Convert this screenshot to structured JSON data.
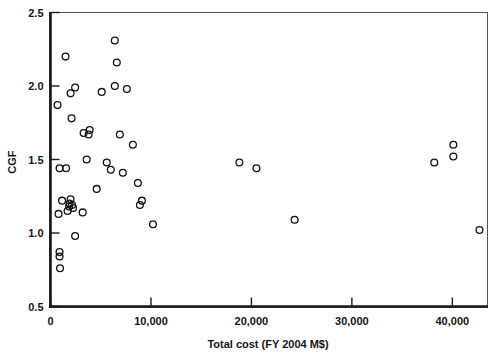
{
  "chart_data": {
    "type": "scatter",
    "title": "",
    "xlabel": "Total cost (FY 2004 M$)",
    "ylabel": "CGF",
    "xlim": [
      0,
      43500
    ],
    "ylim": [
      0.5,
      2.5
    ],
    "xticks": [
      0,
      10000,
      20000,
      30000,
      40000
    ],
    "xticklabels": [
      "0",
      "10,000",
      "20,000",
      "30,000",
      "40,000"
    ],
    "yticks": [
      0.5,
      1.0,
      1.5,
      2.0,
      2.5
    ],
    "yticklabels": [
      "0.5",
      "1.0",
      "1.5",
      "2.0",
      "2.5"
    ],
    "grid": false,
    "legend": false,
    "marker": "open-circle",
    "marker_color": "#111111",
    "points": [
      {
        "x": 700,
        "y": 1.87
      },
      {
        "x": 1500,
        "y": 2.2
      },
      {
        "x": 900,
        "y": 1.44
      },
      {
        "x": 1550,
        "y": 1.44
      },
      {
        "x": 1150,
        "y": 1.22
      },
      {
        "x": 800,
        "y": 1.13
      },
      {
        "x": 1900,
        "y": 1.2
      },
      {
        "x": 2000,
        "y": 1.23
      },
      {
        "x": 1850,
        "y": 1.18
      },
      {
        "x": 1700,
        "y": 1.15
      },
      {
        "x": 2150,
        "y": 1.19
      },
      {
        "x": 2250,
        "y": 1.17
      },
      {
        "x": 900,
        "y": 0.87
      },
      {
        "x": 900,
        "y": 0.84
      },
      {
        "x": 950,
        "y": 0.76
      },
      {
        "x": 2000,
        "y": 1.95
      },
      {
        "x": 2450,
        "y": 1.99
      },
      {
        "x": 2100,
        "y": 1.78
      },
      {
        "x": 2450,
        "y": 0.98
      },
      {
        "x": 3200,
        "y": 1.14
      },
      {
        "x": 3300,
        "y": 1.68
      },
      {
        "x": 3900,
        "y": 1.7
      },
      {
        "x": 3800,
        "y": 1.67
      },
      {
        "x": 3600,
        "y": 1.5
      },
      {
        "x": 4600,
        "y": 1.3
      },
      {
        "x": 5100,
        "y": 1.96
      },
      {
        "x": 5600,
        "y": 1.48
      },
      {
        "x": 6000,
        "y": 1.43
      },
      {
        "x": 6400,
        "y": 2.31
      },
      {
        "x": 6600,
        "y": 2.16
      },
      {
        "x": 6400,
        "y": 2.0
      },
      {
        "x": 6900,
        "y": 1.67
      },
      {
        "x": 7200,
        "y": 1.41
      },
      {
        "x": 7600,
        "y": 1.98
      },
      {
        "x": 8200,
        "y": 1.6
      },
      {
        "x": 8700,
        "y": 1.34
      },
      {
        "x": 9100,
        "y": 1.22
      },
      {
        "x": 8900,
        "y": 1.19
      },
      {
        "x": 10200,
        "y": 1.06
      },
      {
        "x": 18800,
        "y": 1.48
      },
      {
        "x": 20500,
        "y": 1.44
      },
      {
        "x": 24300,
        "y": 1.09
      },
      {
        "x": 38200,
        "y": 1.48
      },
      {
        "x": 40100,
        "y": 1.6
      },
      {
        "x": 40100,
        "y": 1.52
      },
      {
        "x": 42700,
        "y": 1.02
      }
    ]
  }
}
